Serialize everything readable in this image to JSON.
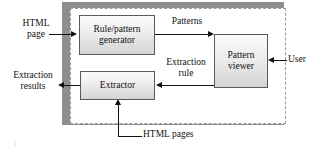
{
  "diagram": {
    "boundary": {
      "name": "system-boundary",
      "style": "dashed"
    },
    "boxes": [
      {
        "id": "generator",
        "label": "Rule/pattern\ngenerator"
      },
      {
        "id": "extractor",
        "label": "Extractor"
      },
      {
        "id": "viewer",
        "label": "Pattern\nviewer"
      }
    ],
    "labels": {
      "html_page": "HTML\npage",
      "extraction_results": "Extraction\nresults",
      "patterns": "Patterns",
      "extraction_rule": "Extraction\nrule",
      "user": "User",
      "html_pages": "HTML pages"
    },
    "flows": [
      {
        "id": "html-page-to-generator",
        "from": "HTML page",
        "to": "Rule/pattern generator",
        "label": ""
      },
      {
        "id": "generator-to-viewer",
        "from": "Rule/pattern generator",
        "to": "Pattern viewer",
        "label": "Patterns"
      },
      {
        "id": "viewer-to-extractor",
        "from": "Pattern viewer",
        "to": "Extractor",
        "label": "Extraction rule"
      },
      {
        "id": "extractor-to-results",
        "from": "Extractor",
        "to": "Extraction results",
        "label": ""
      },
      {
        "id": "user-to-viewer",
        "from": "User",
        "to": "Pattern viewer",
        "label": ""
      },
      {
        "id": "html-pages-to-extractor",
        "from": "HTML pages",
        "to": "Extractor",
        "label": ""
      }
    ],
    "colors": {
      "box_border": "#5a5a5a",
      "box_fill_top": "#fbfbfb",
      "box_fill_bottom": "#d4d4d4",
      "boundary_shadow": "#8e8e8e",
      "boundary_dash": "#9a9a9a",
      "arrow": "#111111",
      "text": "#111111"
    }
  }
}
